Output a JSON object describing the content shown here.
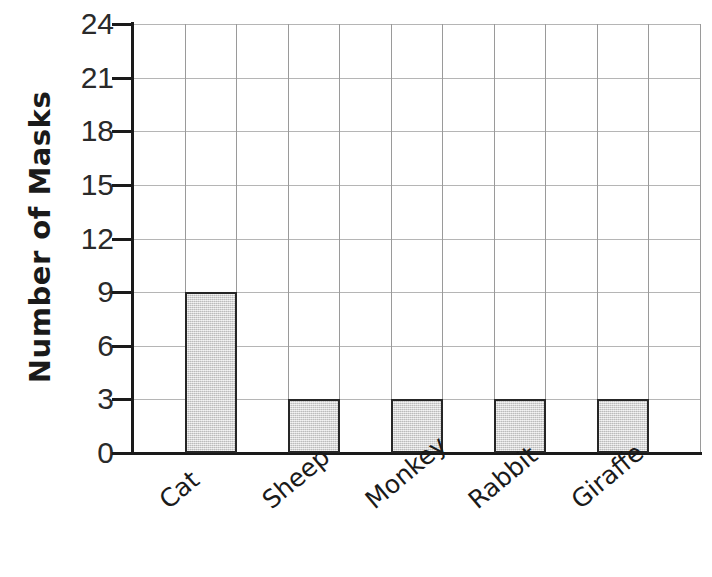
{
  "chart_data": {
    "type": "bar",
    "title": "",
    "xlabel": "",
    "ylabel": "Number of Masks",
    "categories": [
      "Cat",
      "Sheep",
      "Monkey",
      "Rabbit",
      "Giraffe"
    ],
    "values": [
      9,
      3,
      3,
      3,
      3
    ],
    "ylim": [
      0,
      24
    ],
    "y_ticks": [
      0,
      3,
      6,
      9,
      12,
      15,
      18,
      21,
      24
    ],
    "y_tick_labels": [
      "0",
      "3",
      "6",
      "9",
      "12",
      "15",
      "18",
      "21",
      "24"
    ],
    "grid": true,
    "grid_columns": 11,
    "legend": "none",
    "bar_fill_color": "#d2d2d2",
    "bar_border_color": "#262626",
    "gridline_color": "#b5b5b5",
    "axis_color": "#1a1a1a",
    "background_color": "#ffffff",
    "x_label_rotation": -40
  },
  "axes": {
    "y_title": "Number of Masks"
  }
}
